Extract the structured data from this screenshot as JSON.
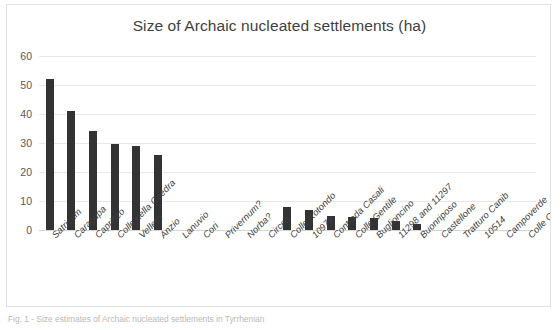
{
  "chart_data": {
    "type": "bar",
    "title": "Size of Archaic nucleated settlements (ha)",
    "xlabel": "",
    "ylabel": "",
    "ylim": [
      0,
      60
    ],
    "yticks": [
      0,
      10,
      20,
      30,
      40,
      50,
      60
    ],
    "grid": true,
    "legend": false,
    "bar_color": "#333333",
    "categories": [
      "Satricum",
      "Caracupa",
      "Caprifico",
      "Colle della Coedra",
      "Velletri",
      "Anzio",
      "Lanuvio",
      "Cori",
      "Privernum?",
      "Norba?",
      "Circeii",
      "Colle Rotondo",
      "10979",
      "Contrada Casali",
      "Colle Gentile",
      "Buglioncino",
      "11298 and 11297",
      "Buonriposo",
      "Castellone",
      "Tratturo Canib",
      "10514",
      "Campoverde",
      "Colle Ottone?"
    ],
    "values": [
      52,
      41,
      34,
      29.5,
      29,
      26,
      0,
      0,
      0,
      0,
      0,
      8,
      7,
      5,
      4.5,
      4.2,
      3,
      2,
      0,
      0,
      0,
      0,
      0
    ]
  },
  "caption": {
    "text": "Fig. 1 - Size estimates of Archaic nucleated settlements in Tyrrhenian"
  }
}
